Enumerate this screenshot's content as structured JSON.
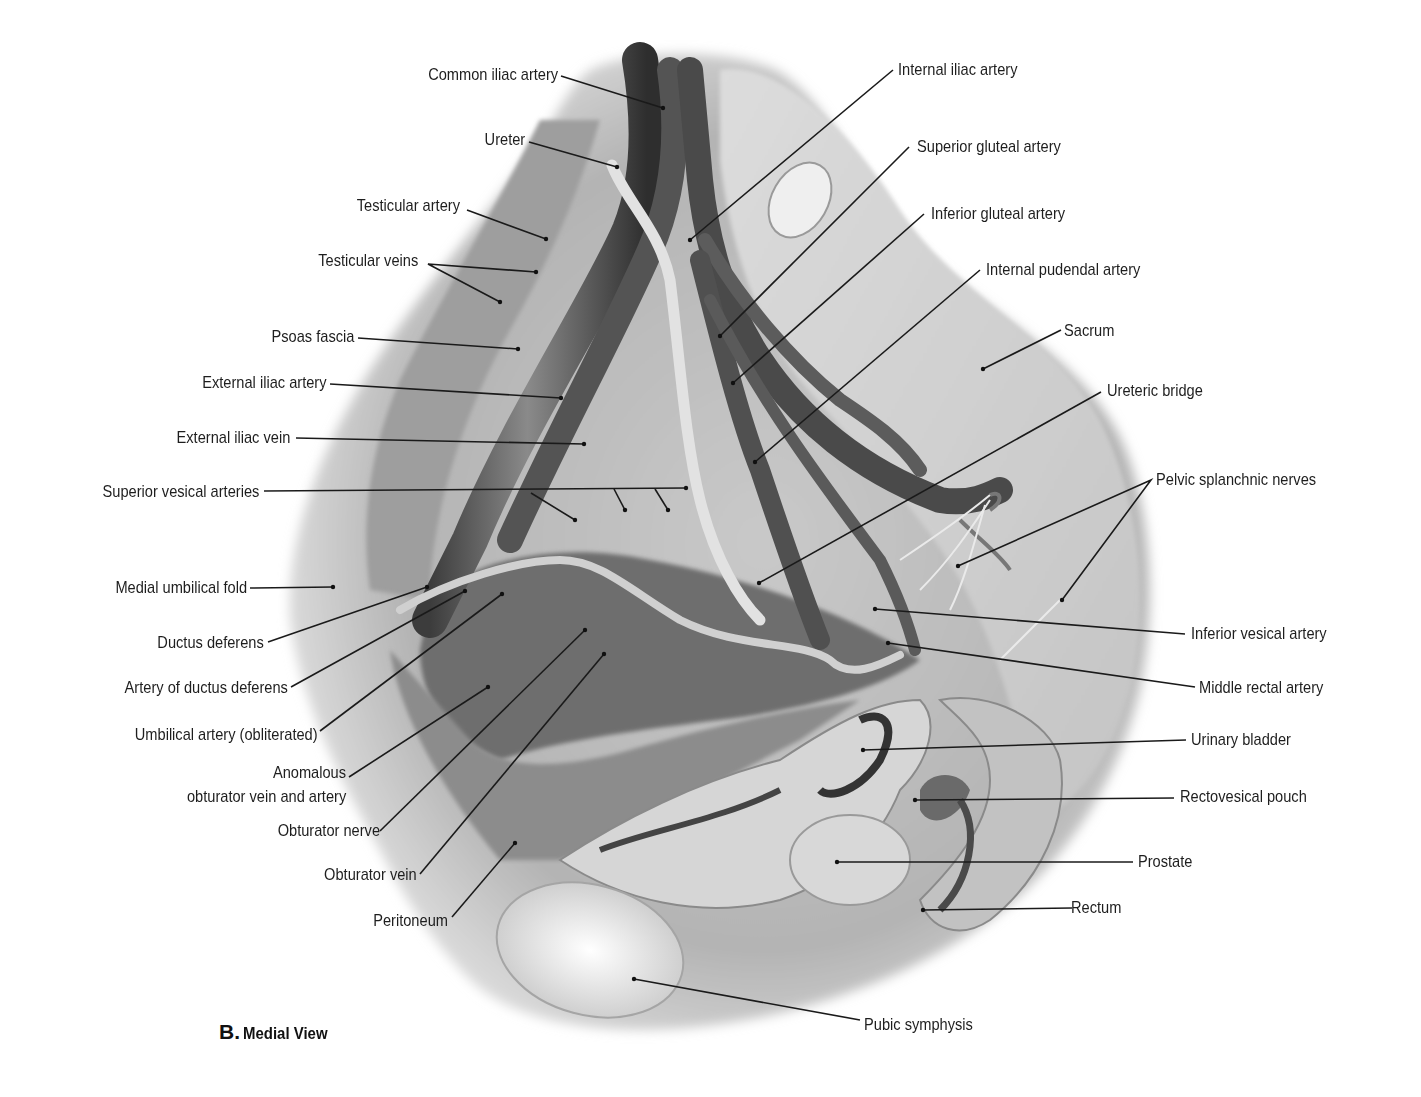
{
  "figure": {
    "panel_letter": "B.",
    "view_title": "Medial View",
    "style": "grayscale anatomical illustration",
    "colors": {
      "background": "#ffffff",
      "label_text": "#1e1e1e",
      "leader_line": "#1a1a1a"
    }
  },
  "labels": {
    "common_iliac_artery": "Common iliac artery",
    "ureter": "Ureter",
    "testicular_artery": "Testicular artery",
    "testicular_veins": "Testicular veins",
    "psoas_fascia": "Psoas fascia",
    "external_iliac_artery": "External iliac artery",
    "external_iliac_vein": "External iliac vein",
    "superior_vesical_arteries": "Superior vesical arteries",
    "medial_umbilical_fold": "Medial umbilical fold",
    "ductus_deferens": "Ductus deferens",
    "artery_of_ductus_deferens": "Artery of ductus deferens",
    "umbilical_artery": "Umbilical artery (obliterated)",
    "anomalous_line1": "Anomalous",
    "anomalous_line2": "obturator vein and artery",
    "obturator_nerve": "Obturator nerve",
    "obturator_vein": "Obturator vein",
    "peritoneum": "Peritoneum",
    "internal_iliac_artery": "Internal iliac artery",
    "superior_gluteal_artery": "Superior gluteal artery",
    "inferior_gluteal_artery": "Inferior gluteal artery",
    "internal_pudendal_artery": "Internal pudendal artery",
    "sacrum": "Sacrum",
    "ureteric_bridge": "Ureteric bridge",
    "pelvic_splanchnic_nerves": "Pelvic splanchnic nerves",
    "inferior_vesical_artery": "Inferior vesical artery",
    "middle_rectal_artery": "Middle rectal artery",
    "urinary_bladder": "Urinary bladder",
    "rectovesical_pouch": "Rectovesical pouch",
    "prostate": "Prostate",
    "rectum": "Rectum",
    "pubic_symphysis": "Pubic symphysis"
  }
}
